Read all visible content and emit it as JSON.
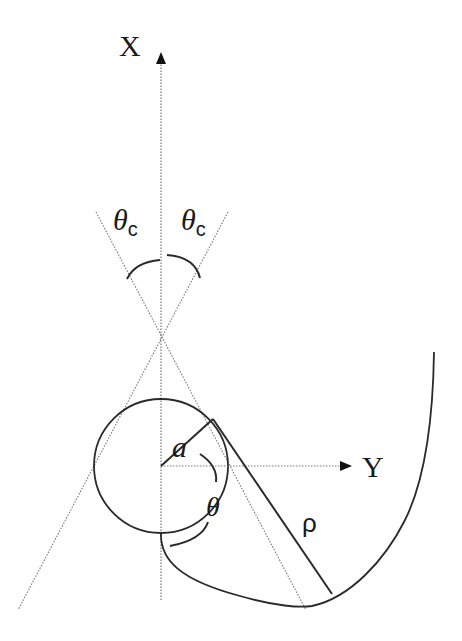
{
  "diagram": {
    "type": "geometry-schematic",
    "axes": {
      "x_label": "X",
      "y_label": "Y"
    },
    "labels": {
      "cone_angle_left": "θ",
      "cone_angle_left_sub": "c",
      "cone_angle_right": "θ",
      "cone_angle_right_sub": "c",
      "radius": "a",
      "angle": "θ",
      "distance": "ρ"
    },
    "colors": {
      "stroke": "#2a2a2a",
      "dotted": "#777777",
      "background": "#ffffff"
    }
  }
}
